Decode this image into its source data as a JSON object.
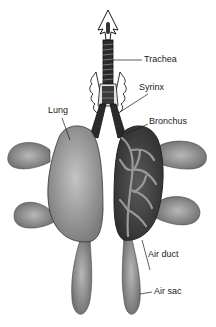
{
  "diagram": {
    "labels": {
      "trachea": "Trachea",
      "syrinx": "Syrinx",
      "lung": "Lung",
      "bronchus": "Bronchus",
      "air_duct": "Air duct",
      "air_sac": "Air sac"
    },
    "colors": {
      "line": "#1a1a1a",
      "light_fill": "#a8a8a8",
      "dark_fill": "#4a4a4a",
      "background": "#ffffff"
    }
  }
}
